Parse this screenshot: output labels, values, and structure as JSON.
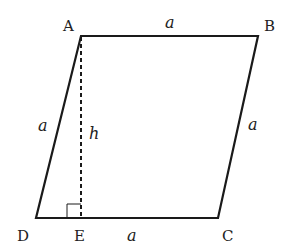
{
  "diagram": {
    "vertices": {
      "A": {
        "label": "A",
        "x": 81,
        "y": 36
      },
      "B": {
        "label": "B",
        "x": 258,
        "y": 36
      },
      "C": {
        "label": "C",
        "x": 218,
        "y": 218
      },
      "D": {
        "label": "D",
        "x": 36,
        "y": 218
      },
      "E": {
        "label": "E",
        "x": 81,
        "y": 218
      }
    },
    "side_labels": {
      "AB": "a",
      "AD": "a",
      "BC": "a",
      "EC": "a",
      "height": "h"
    },
    "stroke_color": "#1a1a1a",
    "right_angle_at": "E"
  }
}
